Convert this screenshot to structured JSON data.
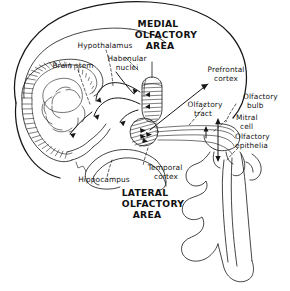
{
  "figure": {
    "background_color": "#ffffff",
    "ink_color": "#161616",
    "width": 290,
    "height": 291
  },
  "labels": {
    "hypothalamus": "Hypothalamus",
    "brain_stem": "Brain stem",
    "habenular_nuclei_line1": "Habenular",
    "habenular_nuclei_line2": "nuclei",
    "medial_area_line1": "MEDIAL",
    "medial_area_line2": "OLFACTORY",
    "medial_area_line3": "AREA",
    "prefrontal_cortex_line1": "Prefrontal",
    "prefrontal_cortex_line2": "cortex",
    "olfactory_tract_line1": "Olfactory",
    "olfactory_tract_line2": "tract",
    "olfactory_bulb_line1": "Olfactory",
    "olfactory_bulb_line2": "bulb",
    "mitral_cell_line1": "Mitral",
    "mitral_cell_line2": "cell",
    "olfactory_epithelia_line1": "Olfactory",
    "olfactory_epithelia_line2": "epithelia",
    "temporal_cortex_line1": "Temporal",
    "temporal_cortex_line2": "cortex",
    "hippocampus": "Hippocampus",
    "lateral_area_line1": "LATERAL",
    "lateral_area_line2": "OLFACTORY",
    "lateral_area_line3": "AREA"
  },
  "structures": {
    "cerebrum_outline": "cerebrum-outline",
    "cerebellum": "cerebellum",
    "brainstem_body": "brain-stem-body",
    "medial_olfactory_area_shape": "hatched-elongated-oval",
    "lateral_olfactory_area_shape": "hatched-circle",
    "olfactory_bulb_shape": "elongated-bulb",
    "nasal_cavity_shape": "nasal-cavity-turbinates",
    "hippocampus_curve": "hippocampus-arc",
    "temporal_lobe_curve": "temporal-lobe-arc"
  },
  "connections": {
    "medial_to_hypothalamus": "curved-arrow",
    "medial_to_brain_stem": "curved-arrow",
    "medial_to_habenular": "curved-arrow",
    "lateral_to_prefrontal": "straight-arrow",
    "lateral_to_temporal": "dashed-leader",
    "bulb_to_lateral_tract": "olfactory-tract-lines",
    "epithelia_to_bulb": "double-headed-arrow"
  }
}
